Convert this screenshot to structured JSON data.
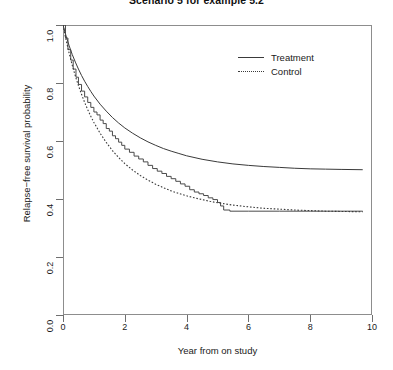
{
  "chart_data": {
    "type": "line",
    "title": "Scenario 5 for example 5.2",
    "xlabel": "Year from on study",
    "ylabel": "Relapse−free survival probability",
    "xlim": [
      0,
      10
    ],
    "ylim": [
      0,
      1
    ],
    "xticks": [
      0,
      2,
      4,
      6,
      8,
      10
    ],
    "xtick_labels": [
      "0",
      "2",
      "4",
      "6",
      "8",
      "10"
    ],
    "yticks": [
      0.0,
      0.2,
      0.4,
      0.6,
      0.8,
      1.0
    ],
    "ytick_labels": [
      "0.0",
      "0.2",
      "0.4",
      "0.6",
      "0.8",
      "1.0"
    ],
    "grid": false,
    "legend_position": "top-right",
    "legend": [
      {
        "name": "Treatment",
        "style": "solid"
      },
      {
        "name": "Control",
        "style": "dotted"
      }
    ],
    "series": [
      {
        "name": "Treatment",
        "style": "solid",
        "plateau": 0.5,
        "points": [
          [
            0.0,
            1.0
          ],
          [
            0.1,
            0.962
          ],
          [
            0.2,
            0.928
          ],
          [
            0.3,
            0.898
          ],
          [
            0.4,
            0.872
          ],
          [
            0.5,
            0.848
          ],
          [
            0.6,
            0.826
          ],
          [
            0.7,
            0.806
          ],
          [
            0.8,
            0.788
          ],
          [
            0.9,
            0.771
          ],
          [
            1.0,
            0.755
          ],
          [
            1.2,
            0.727
          ],
          [
            1.4,
            0.703
          ],
          [
            1.6,
            0.681
          ],
          [
            1.8,
            0.662
          ],
          [
            2.0,
            0.645
          ],
          [
            2.25,
            0.627
          ],
          [
            2.5,
            0.611
          ],
          [
            2.75,
            0.597
          ],
          [
            3.0,
            0.585
          ],
          [
            3.25,
            0.574
          ],
          [
            3.5,
            0.565
          ],
          [
            3.75,
            0.557
          ],
          [
            4.0,
            0.549
          ],
          [
            4.5,
            0.537
          ],
          [
            5.0,
            0.528
          ],
          [
            5.5,
            0.521
          ],
          [
            6.0,
            0.516
          ],
          [
            6.5,
            0.512
          ],
          [
            7.0,
            0.509
          ],
          [
            7.5,
            0.506
          ],
          [
            8.0,
            0.504
          ],
          [
            8.5,
            0.503
          ],
          [
            9.0,
            0.502
          ],
          [
            9.7,
            0.501
          ]
        ]
      },
      {
        "name": "Control",
        "style": "dotted",
        "plateau": 0.355,
        "points": [
          [
            0.0,
            1.0
          ],
          [
            0.1,
            0.948
          ],
          [
            0.2,
            0.902
          ],
          [
            0.3,
            0.861
          ],
          [
            0.4,
            0.824
          ],
          [
            0.5,
            0.791
          ],
          [
            0.6,
            0.761
          ],
          [
            0.7,
            0.733
          ],
          [
            0.8,
            0.708
          ],
          [
            0.9,
            0.685
          ],
          [
            1.0,
            0.664
          ],
          [
            1.2,
            0.627
          ],
          [
            1.4,
            0.595
          ],
          [
            1.6,
            0.567
          ],
          [
            1.8,
            0.543
          ],
          [
            2.0,
            0.522
          ],
          [
            2.25,
            0.5
          ],
          [
            2.5,
            0.481
          ],
          [
            2.75,
            0.465
          ],
          [
            3.0,
            0.451
          ],
          [
            3.25,
            0.439
          ],
          [
            3.5,
            0.428
          ],
          [
            3.75,
            0.419
          ],
          [
            4.0,
            0.411
          ],
          [
            4.25,
            0.404
          ],
          [
            4.5,
            0.398
          ],
          [
            4.75,
            0.392
          ],
          [
            5.0,
            0.387
          ],
          [
            5.5,
            0.379
          ],
          [
            6.0,
            0.373
          ],
          [
            6.5,
            0.368
          ],
          [
            7.0,
            0.365
          ],
          [
            7.5,
            0.362
          ],
          [
            8.0,
            0.36
          ],
          [
            8.5,
            0.358
          ],
          [
            9.0,
            0.357
          ],
          [
            9.7,
            0.356
          ]
        ]
      },
      {
        "name": "Control empirical (Kaplan-Meier steps)",
        "style": "solid-step",
        "plateau": 0.357,
        "points": [
          [
            0.0,
            1.0
          ],
          [
            0.08,
            0.955
          ],
          [
            0.16,
            0.915
          ],
          [
            0.25,
            0.879
          ],
          [
            0.33,
            0.848
          ],
          [
            0.42,
            0.82
          ],
          [
            0.5,
            0.795
          ],
          [
            0.6,
            0.772
          ],
          [
            0.7,
            0.752
          ],
          [
            0.8,
            0.733
          ],
          [
            0.9,
            0.716
          ],
          [
            1.0,
            0.7
          ],
          [
            1.1,
            0.69
          ],
          [
            1.2,
            0.672
          ],
          [
            1.3,
            0.66
          ],
          [
            1.4,
            0.643
          ],
          [
            1.5,
            0.634
          ],
          [
            1.6,
            0.618
          ],
          [
            1.7,
            0.608
          ],
          [
            1.8,
            0.596
          ],
          [
            1.9,
            0.585
          ],
          [
            2.0,
            0.572
          ],
          [
            2.15,
            0.561
          ],
          [
            2.3,
            0.548
          ],
          [
            2.45,
            0.538
          ],
          [
            2.6,
            0.528
          ],
          [
            2.75,
            0.516
          ],
          [
            2.9,
            0.505
          ],
          [
            3.05,
            0.496
          ],
          [
            3.2,
            0.488
          ],
          [
            3.35,
            0.478
          ],
          [
            3.5,
            0.47
          ],
          [
            3.65,
            0.461
          ],
          [
            3.8,
            0.452
          ],
          [
            3.95,
            0.444
          ],
          [
            4.1,
            0.432
          ],
          [
            4.25,
            0.424
          ],
          [
            4.4,
            0.418
          ],
          [
            4.55,
            0.412
          ],
          [
            4.7,
            0.404
          ],
          [
            4.85,
            0.398
          ],
          [
            5.0,
            0.388
          ],
          [
            5.1,
            0.376
          ],
          [
            5.2,
            0.362
          ],
          [
            5.4,
            0.358
          ],
          [
            6.0,
            0.358
          ],
          [
            7.0,
            0.358
          ],
          [
            8.0,
            0.358
          ],
          [
            9.0,
            0.358
          ],
          [
            9.7,
            0.358
          ]
        ]
      }
    ]
  }
}
